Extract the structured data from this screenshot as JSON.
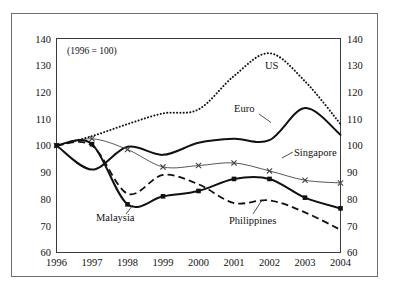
{
  "figure": {
    "note": "(1996 = 100)",
    "background_color": "#ffffff",
    "frame_color": "#6e6e70"
  },
  "chart_data": {
    "type": "line",
    "title": "",
    "subtitle": "",
    "note": "(1996 = 100)",
    "xlabel": "",
    "ylabel": "",
    "xlim": [
      1996,
      2004
    ],
    "ylim": [
      60,
      140
    ],
    "ytick_interval": 10,
    "grid": false,
    "legend_position": "inline-labels",
    "dual_axis": true,
    "categories": [
      "1996",
      "1997",
      "1998",
      "1999",
      "2000",
      "2001",
      "2002",
      "2003",
      "2004"
    ],
    "x": [
      1996,
      1997,
      1998,
      1999,
      2000,
      2001,
      2002,
      2003,
      2004
    ],
    "yticks": [
      60,
      70,
      80,
      90,
      100,
      110,
      120,
      130,
      140
    ],
    "left_axis_ticks": [
      "140",
      "130",
      "120",
      "110",
      "100",
      "90",
      "80",
      "70",
      "60"
    ],
    "right_axis_ticks": [
      "140",
      "130",
      "120",
      "110",
      "100",
      "90",
      "80",
      "70",
      "60"
    ],
    "series": [
      {
        "name": "US",
        "label": "US",
        "style": "dotted",
        "marker": "none",
        "color": "#111111",
        "values": [
          100,
          103.5,
          108,
          112,
          113.5,
          126,
          134.5,
          124,
          108
        ]
      },
      {
        "name": "Euro",
        "label": "Euro",
        "style": "solid-thick",
        "marker": "none",
        "color": "#111111",
        "values": [
          100,
          91,
          99.5,
          96.5,
          101,
          102.5,
          102,
          114,
          104
        ]
      },
      {
        "name": "Singapore",
        "label": "Singapore",
        "style": "solid-thin",
        "marker": "x",
        "color": "#444444",
        "values": [
          100,
          102.5,
          98.5,
          92,
          92.5,
          93.5,
          90.5,
          87,
          86
        ]
      },
      {
        "name": "Malaysia",
        "label": "Malaysia",
        "style": "solid-thick",
        "marker": "square",
        "color": "#111111",
        "values": [
          100,
          100.5,
          78,
          81,
          83,
          87.5,
          87.5,
          80.5,
          76.5
        ]
      },
      {
        "name": "Philippines",
        "label": "Philippines",
        "style": "dashed",
        "marker": "none",
        "color": "#111111",
        "values": [
          100,
          100,
          82,
          89,
          85.5,
          78.5,
          79.5,
          75,
          68.5
        ]
      }
    ],
    "annotations": [
      {
        "text": "US",
        "x": 2001.6,
        "y": 131
      },
      {
        "text": "Euro",
        "x": 2001.1,
        "y": 112.5
      },
      {
        "text": "Singapore",
        "x": 2002.0,
        "y": 93.5
      },
      {
        "text": "Malaysia",
        "x": 1997.7,
        "y": 71.5
      },
      {
        "text": "Philippines",
        "x": 2001.0,
        "y": 70.5
      }
    ]
  }
}
